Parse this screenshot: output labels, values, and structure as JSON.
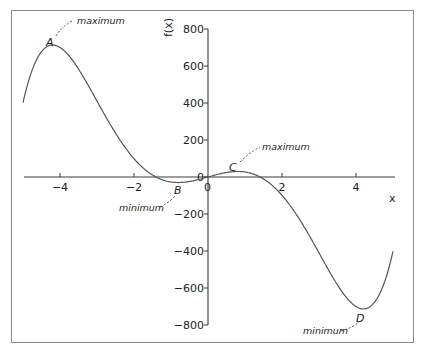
{
  "chart_data": {
    "type": "line",
    "title": "",
    "xlabel": "x",
    "ylabel": "f(x)",
    "xlim": [
      -5,
      5
    ],
    "ylim": [
      -800,
      800
    ],
    "grid": false,
    "legend": null,
    "x_ticks": [
      -4,
      -2,
      0,
      2,
      4
    ],
    "x_tick_labels": [
      "−4",
      "−2",
      "0",
      "2",
      "4"
    ],
    "y_ticks": [
      800,
      600,
      400,
      200,
      0,
      -200,
      -400,
      -600,
      -800
    ],
    "y_tick_labels": [
      "800",
      "600",
      "400",
      "200",
      "0",
      "−200",
      "−400",
      "−600",
      "−800"
    ],
    "series": [
      {
        "name": "f(x)",
        "description": "odd quintic curve, approx f(x) = x^5 - 30.47x^3 + 56.45x",
        "x": [
          -5.0,
          -4.5,
          -4.2,
          -4.0,
          -3.5,
          -3.0,
          -2.5,
          -2.0,
          -1.5,
          -1.0,
          -0.8,
          -0.5,
          0.0,
          0.5,
          0.8,
          1.0,
          1.5,
          2.0,
          2.5,
          3.0,
          3.5,
          4.0,
          4.2,
          4.5,
          5.0
        ],
        "y": [
          402,
          666,
          713,
          704,
          588,
          394,
          187,
          18,
          -7,
          -27,
          -30,
          -25,
          0,
          25,
          30,
          27,
          7,
          -18,
          -187,
          -394,
          -588,
          -704,
          -713,
          -666,
          -402
        ]
      }
    ],
    "annotations": [
      {
        "point": "A",
        "x": -4.2,
        "y": 713,
        "label": "maximum"
      },
      {
        "point": "B",
        "x": -0.8,
        "y": -30,
        "label": "minimum"
      },
      {
        "point": "C",
        "x": 0.8,
        "y": 30,
        "label": "maximum"
      },
      {
        "point": "D",
        "x": 4.2,
        "y": -713,
        "label": "minimum"
      }
    ]
  },
  "labels": {
    "x_axis": "x",
    "y_axis": "f(x)",
    "points": [
      "A",
      "B",
      "C",
      "D"
    ],
    "annotations": [
      "maximum",
      "minimum",
      "maximum",
      "minimum"
    ],
    "x_ticks": [
      "−4",
      "−2",
      "0",
      "2",
      "4"
    ],
    "y_ticks": [
      "800",
      "600",
      "400",
      "200",
      "0",
      "−200",
      "−400",
      "−600",
      "−800"
    ]
  },
  "colors": {
    "curve": "#555555",
    "axes": "#3a3a3a",
    "frame": "#8a8a8a",
    "background": "#ffffff"
  }
}
